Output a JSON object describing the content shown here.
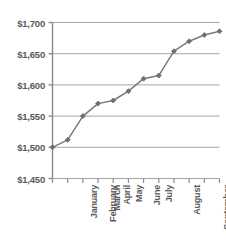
{
  "chart_data": {
    "type": "line",
    "title": "",
    "xlabel": "",
    "ylabel": "",
    "categories": [
      "January",
      "February",
      "March",
      "April",
      "May",
      "June",
      "July",
      "August",
      "September",
      "October",
      "November",
      "December"
    ],
    "values": [
      1500,
      1512,
      1550,
      1570,
      1575,
      1590,
      1610,
      1615,
      1654,
      1670,
      1680,
      1686
    ],
    "series": [
      {
        "name": "Value",
        "values": [
          1500,
          1512,
          1550,
          1570,
          1575,
          1590,
          1610,
          1615,
          1654,
          1670,
          1680,
          1686
        ]
      }
    ],
    "ylim": [
      1450,
      1700
    ],
    "ytick_values": [
      1450,
      1500,
      1550,
      1600,
      1650,
      1700
    ],
    "ytick_labels": [
      "$1,450",
      "$1,500",
      "$1,550",
      "$1,600",
      "$1,650",
      "$1,700"
    ],
    "grid": true,
    "legend": false,
    "line_color": "#7b7b7b",
    "marker_color": "#6e6e6e",
    "grid_color": "#a6a6a6",
    "axis_color": "#8c8c8c",
    "text_color": "#58595b"
  }
}
